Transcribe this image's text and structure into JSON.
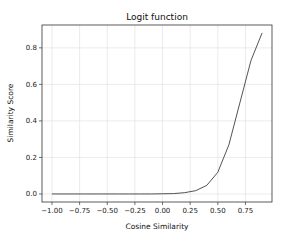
{
  "chart_data": {
    "type": "line",
    "title": "Logit function",
    "xlabel": "Cosine Similarity",
    "ylabel": "Similarity Score",
    "xlim": [
      -1.09,
      0.99
    ],
    "ylim": [
      -0.044,
      0.925
    ],
    "grid": true,
    "legend": null,
    "x_ticks": [
      -1.0,
      -0.75,
      -0.5,
      -0.25,
      0.0,
      0.25,
      0.5,
      0.75
    ],
    "x_tick_labels": [
      "−1.00",
      "−0.75",
      "−0.50",
      "−0.25",
      "0.00",
      "0.25",
      "0.50",
      "0.75"
    ],
    "y_ticks": [
      0.0,
      0.2,
      0.4,
      0.6,
      0.8
    ],
    "y_tick_labels": [
      "0.0",
      "0.2",
      "0.4",
      "0.6",
      "0.8"
    ],
    "line_color": "#404040",
    "series": [
      {
        "name": "logit",
        "x": [
          -1.0,
          -0.9,
          -0.8,
          -0.7,
          -0.6,
          -0.5,
          -0.4,
          -0.3,
          -0.2,
          -0.1,
          0.0,
          0.1,
          0.2,
          0.3,
          0.4,
          0.5,
          0.6,
          0.7,
          0.8,
          0.9
        ],
        "values": [
          0.0,
          0.0,
          0.0,
          0.0,
          0.0,
          0.0,
          0.0,
          0.0,
          0.0,
          0.0,
          0.001,
          0.002,
          0.007,
          0.018,
          0.047,
          0.119,
          0.269,
          0.5,
          0.731,
          0.881
        ]
      }
    ]
  }
}
